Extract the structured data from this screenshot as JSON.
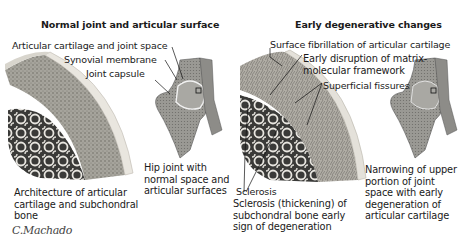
{
  "panels": [
    {
      "title": "Normal joint and articular surface",
      "labels": {
        "cartilage_space": "Articular cartilage and joint space",
        "synovial": "Synovial membrane",
        "capsule": "Joint capsule"
      },
      "captions": {
        "architecture": "Architecture of articular cartilage and subchondral bone",
        "hip": "Hip joint with normal space and articular surfaces"
      }
    },
    {
      "title": "Early degenerative changes",
      "labels": {
        "fibrillation": "Surface fibrillation of articular cartilage",
        "disruption": "Early disruption of matrix-molecular framework",
        "fissures": "Superficial fissures",
        "sclerosis": "Sclerosis"
      },
      "captions": {
        "sclerosis": "Sclerosis (thickening) of subchondral bone early sign of degeneration",
        "narrowing": "Narrowing of upper portion of joint space with early degeneration of articular cartilage"
      }
    }
  ],
  "signature": "C.Machado",
  "colors": {
    "cartilage": "#e6e2da",
    "bone_gray": "#8a8a86",
    "dark": "#2b2b2b",
    "paper": "#ffffff"
  }
}
